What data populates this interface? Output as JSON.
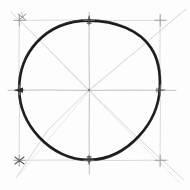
{
  "canvas": {
    "width": 190,
    "height": 190,
    "background_color": "#fdfdfd",
    "title": "Hand-drawn circle inscribed in square construction"
  },
  "palette": {
    "circle_stroke": "#1a1a1a",
    "construction_stroke": "#b9b9bd",
    "construction_stroke_faint": "#d6d6da",
    "tick_stroke": "#8e8e96",
    "paper": "#fdfdfd"
  },
  "figure": {
    "center": {
      "x": 89,
      "y": 90
    },
    "circle": {
      "label": "inscribed-circle",
      "radius_x": 70,
      "radius_y": 69,
      "stroke_width": 2.6,
      "stroke_color": "#1a1a1a",
      "style": "hand-drawn-freehand"
    },
    "bounding_square": {
      "label": "construction-square",
      "left": 19,
      "top": 20,
      "right": 160,
      "bottom": 160,
      "stroke_width": 0.7,
      "stroke_color": "#c9c9ce"
    },
    "axes": [
      {
        "name": "horizontal-axis",
        "x1": 8,
        "y1": 90,
        "x2": 176,
        "y2": 90
      },
      {
        "name": "vertical-axis",
        "x1": 89,
        "y1": 12,
        "x2": 89,
        "y2": 174
      }
    ],
    "diagonals": [
      {
        "name": "diagonal-nw-se",
        "x1": 11,
        "y1": 12,
        "x2": 184,
        "y2": 180
      },
      {
        "name": "diagonal-ne-sw",
        "x1": 186,
        "y1": 9,
        "x2": 16,
        "y2": 178
      }
    ],
    "cardinal_ticks": [
      {
        "name": "tick-top",
        "x": 89,
        "y": 20
      },
      {
        "name": "tick-bottom",
        "x": 89,
        "y": 160
      },
      {
        "name": "tick-left",
        "x": 19,
        "y": 90
      },
      {
        "name": "tick-right",
        "x": 160,
        "y": 90
      }
    ],
    "corner_marks": [
      {
        "name": "corner-mark-top-left",
        "x": 19,
        "y": 20
      },
      {
        "name": "corner-mark-top-right",
        "x": 160,
        "y": 20
      },
      {
        "name": "corner-mark-bottom-left",
        "x": 19,
        "y": 160
      },
      {
        "name": "corner-mark-bottom-right",
        "x": 160,
        "y": 160
      }
    ],
    "stray_mark": {
      "name": "stray-pencil-mark-top-left",
      "x": 22,
      "y": 17,
      "description": "small x-shaped pencil scuff above top-left corner"
    }
  },
  "chart_data": {
    "type": "scatter",
    "xlabel": "",
    "ylabel": "",
    "xlim": [
      0,
      190
    ],
    "ylim": [
      0,
      190
    ],
    "grid": false,
    "legend": null,
    "annotations": [
      "circle center at (89, 90)",
      "circle radius approximately 70 px",
      "square spans x 19 to 160, y 20 to 160",
      "two perpendicular axes and two diagonals intersect at center",
      "tangent tick marks at four cardinal points"
    ],
    "series": [
      {
        "name": "circle-cardinal-points",
        "x": [
          19,
          89,
          160,
          89
        ],
        "y": [
          90,
          20,
          90,
          160
        ]
      },
      {
        "name": "square-corners",
        "x": [
          19,
          160,
          160,
          19
        ],
        "y": [
          20,
          20,
          160,
          160
        ]
      },
      {
        "name": "center-point",
        "x": [
          89
        ],
        "y": [
          90
        ]
      }
    ]
  }
}
